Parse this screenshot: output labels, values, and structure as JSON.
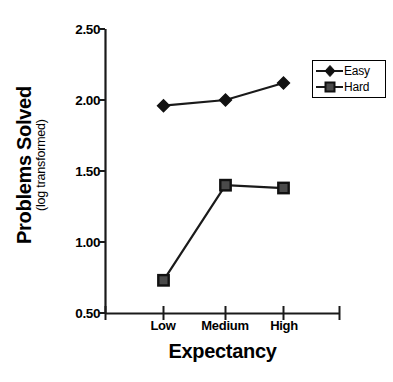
{
  "chart_data": {
    "type": "line",
    "title": "",
    "xlabel": "Expectancy",
    "ylabel": "Problems Solved",
    "ylabel_sub": "(log transformed)",
    "categories": [
      "Low",
      "Medium",
      "High"
    ],
    "series": [
      {
        "name": "Easy",
        "marker": "diamond",
        "values": [
          1.96,
          2.0,
          2.12
        ]
      },
      {
        "name": "Hard",
        "marker": "square",
        "values": [
          0.73,
          1.4,
          1.38
        ]
      }
    ],
    "ylim": [
      0.5,
      2.5
    ],
    "ytick_labels": [
      "2.50",
      "2.00",
      "1.50",
      "1.00",
      "0.50"
    ],
    "ytick_values": [
      2.5,
      2.0,
      1.5,
      1.0,
      0.5
    ],
    "grid": false,
    "legend_position": "top-right",
    "colors": {
      "line": "#1a1a1a",
      "axis": "#1a1a1a",
      "easy_marker": "#111111",
      "hard_marker": "#4a4a4a",
      "background": "#ffffff"
    }
  },
  "axes": {
    "y_title_main": "Problems Solved",
    "y_title_sub": "(log transformed)",
    "x_title": "Expectancy",
    "y_ticks": [
      {
        "label": "2.50",
        "value": 2.5
      },
      {
        "label": "2.00",
        "value": 2.0
      },
      {
        "label": "1.50",
        "value": 1.5
      },
      {
        "label": "1.00",
        "value": 1.0
      },
      {
        "label": "0.50",
        "value": 0.5
      }
    ],
    "x_ticks": [
      {
        "label": "Low"
      },
      {
        "label": "Medium"
      },
      {
        "label": "High"
      }
    ]
  },
  "legend": {
    "entries": [
      {
        "label": "Easy",
        "marker": "diamond-marker"
      },
      {
        "label": "Hard",
        "marker": "square-marker"
      }
    ]
  }
}
